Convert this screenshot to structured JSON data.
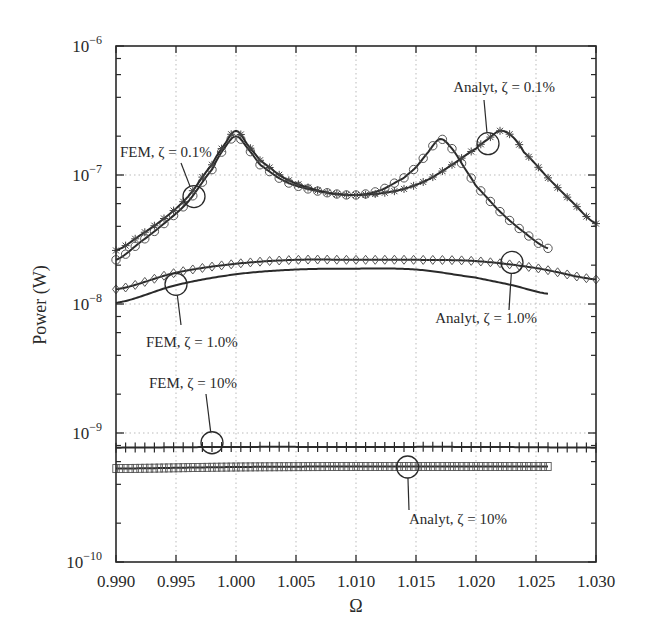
{
  "chart_data": {
    "type": "line",
    "title": "",
    "xlabel": "Ω",
    "ylabel": "Power (W)",
    "xscale": "linear",
    "yscale": "log",
    "xlim": [
      0.99,
      1.03
    ],
    "ylim": [
      1e-10,
      1e-06
    ],
    "grid": true,
    "x_ticks": [
      "0.990",
      "0.995",
      "1.000",
      "1.005",
      "1.010",
      "1.015",
      "1.020",
      "1.025",
      "1.030"
    ],
    "y_ticks": [
      {
        "base": "10",
        "exp": "−6",
        "value": 1e-06
      },
      {
        "base": "10",
        "exp": "−7",
        "value": 1e-07
      },
      {
        "base": "10",
        "exp": "−8",
        "value": 1e-08
      },
      {
        "base": "10",
        "exp": "−9",
        "value": 1e-09
      },
      {
        "base": "10",
        "exp": "−10",
        "value": 1e-10
      }
    ],
    "series": [
      {
        "name": "FEM, ζ = 0.1%",
        "marker": "circle",
        "line": "solid",
        "x": [
          0.99,
          0.992,
          0.994,
          0.996,
          0.998,
          0.999,
          1.0,
          1.001,
          1.002,
          1.004,
          1.006,
          1.008,
          1.01,
          1.012,
          1.014,
          1.015,
          1.016,
          1.017,
          1.018,
          1.019,
          1.02,
          1.022,
          1.024,
          1.026
        ],
        "y": [
          2.2e-08,
          3e-08,
          4.2e-08,
          6.2e-08,
          1.1e-07,
          1.6e-07,
          2e-07,
          1.6e-07,
          1.2e-07,
          9e-08,
          7.8e-08,
          7.2e-08,
          7e-08,
          7.6e-08,
          9.5e-08,
          1.15e-07,
          1.5e-07,
          1.9e-07,
          1.6e-07,
          1.15e-07,
          8.2e-08,
          5.2e-08,
          3.6e-08,
          2.7e-08
        ]
      },
      {
        "name": "Analyt, ζ = 0.1%",
        "marker": "star",
        "line": "solid",
        "x": [
          0.99,
          0.992,
          0.994,
          0.996,
          0.998,
          0.999,
          1.0,
          1.001,
          1.002,
          1.004,
          1.006,
          1.008,
          1.01,
          1.012,
          1.014,
          1.016,
          1.018,
          1.02,
          1.021,
          1.022,
          1.023,
          1.024,
          1.026,
          1.028,
          1.03
        ],
        "y": [
          2.6e-08,
          3.4e-08,
          4.6e-08,
          6.8e-08,
          1.2e-07,
          1.7e-07,
          2.2e-07,
          1.7e-07,
          1.3e-07,
          9.5e-08,
          8e-08,
          7.2e-08,
          7e-08,
          7.2e-08,
          7.8e-08,
          9.2e-08,
          1.2e-07,
          1.6e-07,
          1.9e-07,
          2.2e-07,
          2e-07,
          1.5e-07,
          9.5e-08,
          6.2e-08,
          4.2e-08
        ]
      },
      {
        "name": "Analyt, ζ = 1.0%",
        "marker": "diamond",
        "line": "solid",
        "x": [
          0.99,
          0.995,
          1.0,
          1.005,
          1.01,
          1.015,
          1.02,
          1.025,
          1.03
        ],
        "y": [
          1.3e-08,
          1.75e-08,
          2.05e-08,
          2.2e-08,
          2.2e-08,
          2.2e-08,
          2.15e-08,
          1.9e-08,
          1.55e-08
        ]
      },
      {
        "name": "FEM, ζ = 1.0%",
        "marker": "none",
        "line": "solid",
        "x": [
          0.99,
          0.995,
          1.0,
          1.005,
          1.01,
          1.015,
          1.02,
          1.023,
          1.026
        ],
        "y": [
          1.02e-08,
          1.4e-08,
          1.7e-08,
          1.85e-08,
          1.88e-08,
          1.85e-08,
          1.6e-08,
          1.4e-08,
          1.2e-08
        ]
      },
      {
        "name": "FEM, ζ = 10%",
        "marker": "plus",
        "line": "solid",
        "x": [
          0.99,
          1.0,
          1.01,
          1.02,
          1.03
        ],
        "y": [
          7.7e-10,
          7.8e-10,
          7.8e-10,
          7.8e-10,
          7.7e-10
        ]
      },
      {
        "name": "Analyt, ζ = 10%",
        "marker": "square",
        "line": "solid",
        "x": [
          0.99,
          1.0,
          1.01,
          1.02,
          1.026
        ],
        "y": [
          5.3e-10,
          5.45e-10,
          5.5e-10,
          5.5e-10,
          5.5e-10
        ]
      }
    ],
    "annotations": [
      {
        "text": "FEM, ζ = 0.1%",
        "target": [
          0.9965,
          6.8e-08
        ]
      },
      {
        "text": "Analyt, ζ = 0.1%",
        "target": [
          1.021,
          1.75e-07
        ]
      },
      {
        "text": "FEM, ζ = 1.0%",
        "target": [
          0.995,
          1.42e-08
        ]
      },
      {
        "text": "Analyt, ζ = 1.0%",
        "target": [
          1.023,
          2.1e-08
        ]
      },
      {
        "text": "FEM, ζ = 10%",
        "target": [
          0.998,
          8.4e-10
        ]
      },
      {
        "text": "Analyt, ζ = 10%",
        "target": [
          1.0143,
          5.45e-10
        ]
      }
    ]
  }
}
